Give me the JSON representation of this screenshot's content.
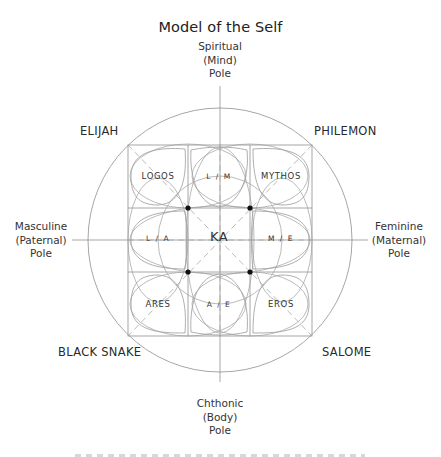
{
  "title": "Model of the Self",
  "poles": {
    "top": [
      "Spiritual",
      "(Mind)",
      "Pole"
    ],
    "bottom": [
      "Chthonic",
      "(Body)",
      "Pole"
    ],
    "left": [
      "Masculine",
      "(Paternal)",
      "Pole"
    ],
    "right": [
      "Feminine",
      "(Maternal)",
      "Pole"
    ]
  },
  "corners": {
    "top_left": "ELIJAH",
    "top_right": "PHILEMON",
    "bottom_left": "BLACK SNAKE",
    "bottom_right": "SALOME"
  },
  "grid": {
    "rows": [
      [
        "LOGOS",
        "L / M",
        "MYTHOS"
      ],
      [
        "L / A",
        "KA",
        "M / E"
      ],
      [
        "ARES",
        "A / E",
        "EROS"
      ]
    ]
  },
  "colors": {
    "line": "#8a8a8a",
    "text": "#2b2b2b",
    "dot": "#111111"
  }
}
